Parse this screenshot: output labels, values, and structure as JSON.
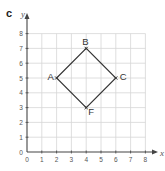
{
  "part_label": "c",
  "axes": {
    "x_label": "x",
    "y_label": "y",
    "x_ticks": [
      "0",
      "1",
      "2",
      "3",
      "4",
      "5",
      "6",
      "7",
      "8"
    ],
    "y_ticks": [
      "0",
      "1",
      "2",
      "3",
      "4",
      "5",
      "6",
      "7",
      "8"
    ],
    "x_range": [
      0,
      8
    ],
    "y_range": [
      0,
      8
    ],
    "grid": true
  },
  "shape": {
    "type": "square",
    "points": [
      {
        "label": "A",
        "x": 2,
        "y": 5
      },
      {
        "label": "B",
        "x": 4,
        "y": 7
      },
      {
        "label": "C",
        "x": 6,
        "y": 5
      },
      {
        "label": "F",
        "x": 4,
        "y": 3
      }
    ]
  },
  "colors": {
    "grid": "#d6d6d6",
    "axis": "#444444",
    "shape": "#333333",
    "text": "#555555"
  }
}
